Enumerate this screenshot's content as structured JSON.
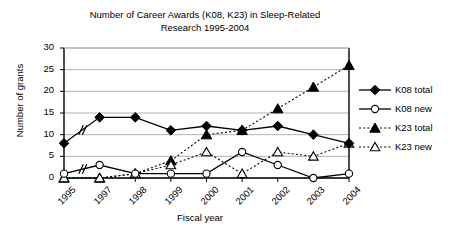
{
  "chart_data": {
    "type": "line",
    "title": "Number of Career Awards (K08, K23) in Sleep-Related\nResearch 1995-2004",
    "xlabel": "Fiscal year",
    "ylabel": "Number of grants",
    "categories": [
      "1995",
      "1997",
      "1998",
      "1999",
      "2000",
      "2001",
      "2002",
      "2003",
      "2004"
    ],
    "ylim": [
      0,
      30
    ],
    "yticks": [
      "0",
      "5",
      "10",
      "15",
      "20",
      "25",
      "30"
    ],
    "grid": "horizontal",
    "legend_position": "right",
    "axis_break": "between 1995 and 1997 (1996 omitted)",
    "series": [
      {
        "name": "K08 total",
        "marker": "filled-diamond",
        "line": "solid",
        "values": [
          8,
          14,
          14,
          11,
          12,
          11,
          12,
          10,
          8
        ]
      },
      {
        "name": "K08 new",
        "marker": "open-circle",
        "line": "solid",
        "values": [
          1,
          3,
          1,
          1,
          1,
          6,
          3,
          0,
          1
        ]
      },
      {
        "name": "K23 total",
        "marker": "filled-triangle",
        "line": "dotted",
        "values": [
          0,
          0,
          1,
          4,
          10,
          11,
          16,
          21,
          26
        ]
      },
      {
        "name": "K23 new",
        "marker": "open-triangle",
        "line": "dotted",
        "values": [
          0,
          0,
          1,
          3,
          6,
          1,
          6,
          5,
          8
        ]
      }
    ]
  },
  "legend": {
    "items": [
      {
        "label": "K08 total"
      },
      {
        "label": "K08 new"
      },
      {
        "label": "K23 total"
      },
      {
        "label": "K23 new"
      }
    ]
  },
  "colors": {
    "axis": "#000000",
    "grid": "#b0b0b0",
    "series": "#000000",
    "background": "#ffffff"
  }
}
